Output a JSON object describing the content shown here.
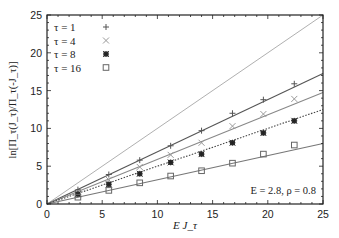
{
  "chart_data": {
    "type": "scatter",
    "title": "",
    "xlabel": "E J_τ",
    "ylabel": "ln[Π_τ(J_τ)/Π_τ(-J_τ)]",
    "xlim": [
      0,
      25
    ],
    "ylim": [
      0,
      25
    ],
    "xticks": [
      0,
      5,
      10,
      15,
      20,
      25
    ],
    "yticks": [
      0,
      5,
      10,
      15,
      20,
      25
    ],
    "grid": false,
    "legend_position": "upper left",
    "annotation": "E = 2.8, ρ = 0.8",
    "reference_line": {
      "name": "y = x",
      "slope": 1.0,
      "color": "#b0b0b0"
    },
    "series": [
      {
        "name": "τ = 1",
        "marker": "plus",
        "x": [
          2.8,
          5.6,
          8.4,
          11.2,
          14.0,
          16.8,
          19.6,
          22.4
        ],
        "y": [
          1.9,
          3.9,
          5.8,
          7.7,
          9.7,
          12.0,
          13.8,
          15.9
        ],
        "fit_slope": 0.69,
        "line_style": "solid",
        "color": "#555555"
      },
      {
        "name": "τ = 4",
        "marker": "cross",
        "x": [
          2.8,
          5.6,
          8.4,
          11.2,
          14.0,
          16.8,
          19.6,
          22.4
        ],
        "y": [
          1.6,
          3.2,
          4.9,
          6.5,
          8.1,
          10.3,
          11.9,
          13.9
        ],
        "fit_slope": 0.59,
        "line_style": "solid",
        "color": "#888888"
      },
      {
        "name": "τ = 8",
        "marker": "star",
        "x": [
          2.8,
          5.6,
          8.4,
          11.2,
          14.0,
          16.8,
          19.6,
          22.4
        ],
        "y": [
          1.3,
          2.6,
          4.0,
          5.5,
          6.6,
          8.1,
          9.4,
          11.0
        ],
        "fit_slope": 0.5,
        "line_style": "dotted",
        "color": "#444444"
      },
      {
        "name": "τ = 16",
        "marker": "square",
        "x": [
          2.8,
          5.6,
          8.4,
          11.2,
          14.0,
          16.8,
          19.6,
          22.4
        ],
        "y": [
          0.9,
          1.8,
          2.8,
          3.7,
          4.4,
          5.4,
          6.6,
          7.8
        ],
        "fit_slope": 0.32,
        "line_style": "solid",
        "color": "#777777"
      }
    ]
  }
}
